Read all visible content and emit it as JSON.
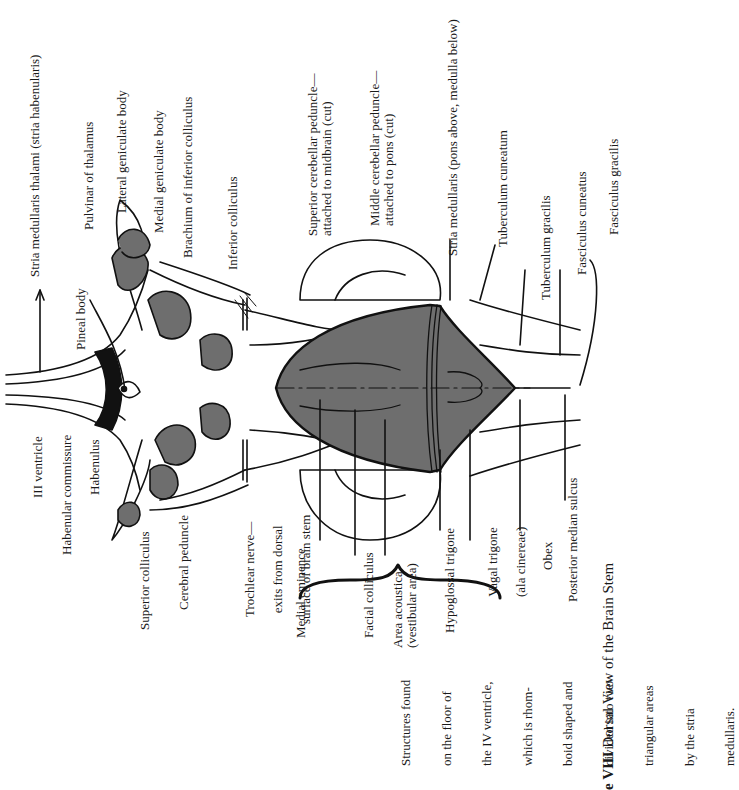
{
  "figure": {
    "caption_number": "e VIII",
    "caption_title": "Dorsal View of the Brain Stem",
    "shade_color": "#6e6e6e",
    "line_color": "#111111"
  },
  "labels": {
    "stria_medullaris_thalami": "Stria medullaris thalami (stria habenularis)",
    "pineal_body": "Pineal body",
    "pulvinar": "Pulvinar of thalamus",
    "lateral_geniculate": "Lateral geniculate body",
    "medial_geniculate": "Medial geniculate body",
    "brachium_inferior_colliculus": "Brachium of inferior colliculus",
    "inferior_colliculus": "Inferior colliculus",
    "superior_cerebellar_peduncle_1": "Superior cerebellar peduncle—",
    "superior_cerebellar_peduncle_2": "attached to midbrain (cut)",
    "middle_cerebellar_peduncle_1": "Middle cerebellar peduncle—",
    "middle_cerebellar_peduncle_2": "attached to pons (cut)",
    "stria_medullaris": "Stria medullaris (pons above, medulla below)",
    "tuberculum_cuneatum": "Tuberculum cuneatum",
    "tuberculum_gracilis": "Tuberculum gracilis",
    "fasciculus_cuneatus": "Fasciculus cuneatus",
    "fasciculus_gracilis": "Fasciculus gracilis",
    "iii_ventricle": "III ventricle",
    "habenular_commissure": "Habenular commissure",
    "habenulus": "Habenulus",
    "superior_colliculus": "Superior colliculus",
    "cerebral_peduncle": "Cerebral peduncle",
    "trochlear_1": "Trochlear nerve—",
    "trochlear_2": "exits from dorsal",
    "trochlear_3": "surface of brain stem",
    "medial_eminence": "Medial eminence",
    "facial_colliculus": "Facial colliculus",
    "area_acoustica_1": "Area acoustica",
    "area_acoustica_2": "(vestibular area)",
    "hypoglossal_trigone": "Hypoglossal trigone",
    "vagal_trigone_1": "Vagal trigone",
    "vagal_trigone_2": "(ala cinereae)",
    "obex": "Obex",
    "posterior_median_sulcus": "Posterior median sulcus"
  },
  "note": {
    "lines": [
      "Structures found",
      "on the floor of",
      "the IV ventricle,",
      "which is rhom-",
      "boid shaped and",
      "divided into two",
      "triangular areas",
      "by the stria",
      "medullaris."
    ]
  }
}
